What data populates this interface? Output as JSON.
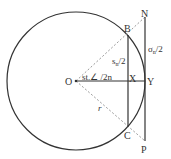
{
  "diagram": {
    "colors": {
      "stroke": "#333333",
      "dashed": "#9a9a9a",
      "background": "#ffffff"
    },
    "points": {
      "O": {
        "label": "O",
        "x": 76,
        "y": 81
      },
      "B": {
        "label": "B",
        "x": 128,
        "y": 35
      },
      "C": {
        "label": "C",
        "x": 128,
        "y": 127
      },
      "X": {
        "label": "X",
        "x": 128,
        "y": 81
      },
      "Y": {
        "label": "Y",
        "x": 145,
        "y": 81
      },
      "N": {
        "label": "N",
        "x": 145,
        "y": 17
      },
      "P": {
        "label": "P",
        "x": 145,
        "y": 141
      }
    },
    "circle": {
      "cx": 76,
      "cy": 81,
      "r": 69
    },
    "labels": {
      "half_chord": "s",
      "half_chord_sub": "n",
      "half_chord_tail": "/2",
      "half_tangent": "σ",
      "half_tangent_sub": "n",
      "half_tangent_tail": "/2",
      "angle": "st.∠ /2n",
      "radius": "r"
    }
  }
}
